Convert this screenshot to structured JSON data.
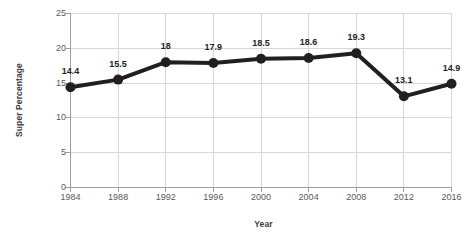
{
  "chart_data": {
    "type": "line",
    "title": "",
    "xlabel": "Year",
    "ylabel": "Super Percentage",
    "categories": [
      "1984",
      "1988",
      "1992",
      "1996",
      "2000",
      "2004",
      "2008",
      "2012",
      "2016"
    ],
    "values": [
      14.4,
      15.5,
      18,
      17.9,
      18.5,
      18.6,
      19.3,
      13.1,
      14.9
    ],
    "point_labels": [
      "14.4",
      "15.5",
      "18",
      "17.9",
      "18.5",
      "18.6",
      "19.3",
      "13.1",
      "14.9"
    ],
    "ylim": [
      0,
      25
    ],
    "yticks": [
      0,
      5,
      10,
      15,
      20,
      25
    ],
    "ytick_labels": [
      "0",
      "5",
      "10",
      "15",
      "20",
      "25"
    ],
    "grid": true,
    "legend": false,
    "series_color": "#231f20",
    "grid_color": "#d7d7d7",
    "axis_color": "#a0a0a0",
    "marker": "circle"
  },
  "axes": {
    "y_title": "Super Percentage",
    "x_title": "Year"
  },
  "caption": {
    "partial_text": ""
  }
}
